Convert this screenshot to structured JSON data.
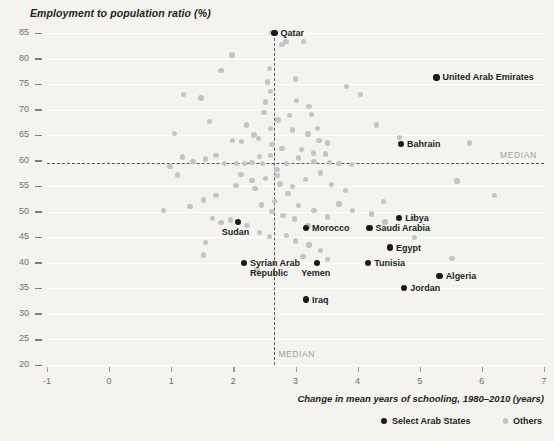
{
  "chart_data": {
    "type": "scatter",
    "title": "Employment to population ratio (%)",
    "ylabel": "Employment to population ratio (%)",
    "xlabel": "Change in mean years of schooling, 1980–2010 (years)",
    "xlim": [
      -1,
      7
    ],
    "ylim": [
      20,
      85
    ],
    "xticks": [
      -1,
      0,
      1,
      2,
      3,
      4,
      5,
      6,
      7
    ],
    "yticks": [
      20,
      25,
      30,
      35,
      40,
      45,
      50,
      55,
      60,
      65,
      70,
      75,
      80,
      85
    ],
    "grid": true,
    "median_x": 2.66,
    "median_y": 59.6,
    "median_label": "MEDIAN",
    "legend_position": "bottom-right",
    "colors": {
      "arab": "#1a1a1a",
      "others": "#c3c4c6",
      "median_line": "#58595b",
      "text": "#231f20",
      "tick_text": "#6d6e71"
    },
    "series": [
      {
        "name": "Select Arab States",
        "color": "#1a1a1a",
        "points": [
          {
            "label": "Qatar",
            "x": 2.66,
            "y": 85.0,
            "label_pos": "right"
          },
          {
            "label": "United Arab Emirates",
            "x": 5.27,
            "y": 76.3,
            "label_pos": "right"
          },
          {
            "label": "Bahrain",
            "x": 4.7,
            "y": 63.3,
            "label_pos": "right"
          },
          {
            "label": "Libya",
            "x": 4.67,
            "y": 48.8,
            "label_pos": "right"
          },
          {
            "label": "Saudi Arabia",
            "x": 4.19,
            "y": 46.8,
            "label_pos": "right"
          },
          {
            "label": "Egypt",
            "x": 4.52,
            "y": 43.0,
            "label_pos": "right"
          },
          {
            "label": "Tunisia",
            "x": 4.17,
            "y": 40.0,
            "label_pos": "right"
          },
          {
            "label": "Algeria",
            "x": 5.32,
            "y": 37.4,
            "label_pos": "right"
          },
          {
            "label": "Jordan",
            "x": 4.75,
            "y": 35.1,
            "label_pos": "right"
          },
          {
            "label": "Morocco",
            "x": 4.32,
            "y": 45.5,
            "label_pos": "right",
            "px": 306,
            "py": 228
          },
          {
            "label": "Yemen",
            "x": 3.35,
            "y": 40.0,
            "label_pos": "below"
          },
          {
            "label": "Iraq",
            "x": 3.17,
            "y": 32.8,
            "label_pos": "right"
          },
          {
            "label": "Sudan",
            "x": 2.07,
            "y": 48.0,
            "label_pos": "below"
          },
          {
            "label": "Syrian Arab\nRepublic",
            "x": 2.17,
            "y": 40.0,
            "label_pos": "right"
          }
        ]
      },
      {
        "name": "Others",
        "color": "#c3c4c6",
        "points": [
          {
            "x": 1.05,
            "y": 65.3
          },
          {
            "x": 1.8,
            "y": 77.6
          },
          {
            "x": 1.98,
            "y": 80.7
          },
          {
            "x": 2.33,
            "y": 65.0
          },
          {
            "x": 2.13,
            "y": 63.8
          },
          {
            "x": 1.99,
            "y": 63.9
          },
          {
            "x": 2.42,
            "y": 60.8
          },
          {
            "x": 2.18,
            "y": 59.4
          },
          {
            "x": 2.7,
            "y": 57.1
          },
          {
            "x": 2.55,
            "y": 75.4
          },
          {
            "x": 3.0,
            "y": 76.0
          },
          {
            "x": 3.22,
            "y": 70.6
          },
          {
            "x": 3.26,
            "y": 69.0
          },
          {
            "x": 3.35,
            "y": 66.3
          },
          {
            "x": 2.95,
            "y": 66.0
          },
          {
            "x": 3.2,
            "y": 65.2
          },
          {
            "x": 3.38,
            "y": 64.0
          },
          {
            "x": 3.52,
            "y": 63.5
          },
          {
            "x": 3.1,
            "y": 62.2
          },
          {
            "x": 3.29,
            "y": 61.5
          },
          {
            "x": 3.48,
            "y": 61.3
          },
          {
            "x": 3.05,
            "y": 60.5
          },
          {
            "x": 3.3,
            "y": 59.9
          },
          {
            "x": 3.55,
            "y": 59.7
          },
          {
            "x": 2.86,
            "y": 59.5
          },
          {
            "x": 3.7,
            "y": 59.4
          },
          {
            "x": 3.9,
            "y": 59.3
          },
          {
            "x": 2.47,
            "y": 59.5
          },
          {
            "x": 2.3,
            "y": 59.6
          },
          {
            "x": 2.05,
            "y": 59.5
          },
          {
            "x": 1.86,
            "y": 59.4
          },
          {
            "x": 2.62,
            "y": 85.1
          },
          {
            "x": 2.85,
            "y": 83.3
          },
          {
            "x": 3.13,
            "y": 83.3
          },
          {
            "x": 2.78,
            "y": 82.7
          },
          {
            "x": 3.82,
            "y": 74.5
          },
          {
            "x": 4.05,
            "y": 73.0
          },
          {
            "x": 4.3,
            "y": 67.0
          },
          {
            "x": 4.67,
            "y": 64.5
          },
          {
            "x": 5.8,
            "y": 63.5
          },
          {
            "x": 5.6,
            "y": 56.0
          },
          {
            "x": 6.2,
            "y": 53.2
          },
          {
            "x": 2.52,
            "y": 71.5
          },
          {
            "x": 2.49,
            "y": 69.4
          },
          {
            "x": 2.21,
            "y": 67.0
          },
          {
            "x": 1.62,
            "y": 67.7
          },
          {
            "x": 1.48,
            "y": 72.3
          },
          {
            "x": 1.2,
            "y": 73.0
          },
          {
            "x": 2.72,
            "y": 68.0
          },
          {
            "x": 2.9,
            "y": 68.8
          },
          {
            "x": 3.02,
            "y": 71.8
          },
          {
            "x": 2.4,
            "y": 64.4
          },
          {
            "x": 2.62,
            "y": 63.2
          },
          {
            "x": 2.78,
            "y": 62.4
          },
          {
            "x": 1.72,
            "y": 61.0
          },
          {
            "x": 1.55,
            "y": 60.3
          },
          {
            "x": 1.35,
            "y": 59.8
          },
          {
            "x": 1.18,
            "y": 60.7
          },
          {
            "x": 0.98,
            "y": 58.9
          },
          {
            "x": 1.1,
            "y": 57.2
          },
          {
            "x": 2.12,
            "y": 57.3
          },
          {
            "x": 2.3,
            "y": 56.1
          },
          {
            "x": 2.52,
            "y": 56.5
          },
          {
            "x": 2.75,
            "y": 55.4
          },
          {
            "x": 2.95,
            "y": 55.0
          },
          {
            "x": 3.16,
            "y": 56.3
          },
          {
            "x": 3.4,
            "y": 57.6
          },
          {
            "x": 3.58,
            "y": 55.3
          },
          {
            "x": 2.88,
            "y": 53.6
          },
          {
            "x": 2.66,
            "y": 52.0
          },
          {
            "x": 2.45,
            "y": 51.3
          },
          {
            "x": 2.62,
            "y": 50.1
          },
          {
            "x": 2.8,
            "y": 49.3
          },
          {
            "x": 3.05,
            "y": 51.2
          },
          {
            "x": 3.3,
            "y": 50.3
          },
          {
            "x": 3.52,
            "y": 49.0
          },
          {
            "x": 3.7,
            "y": 51.5
          },
          {
            "x": 3.92,
            "y": 50.2
          },
          {
            "x": 4.22,
            "y": 49.6
          },
          {
            "x": 4.44,
            "y": 48.0
          },
          {
            "x": 4.88,
            "y": 48.7
          },
          {
            "x": 1.72,
            "y": 53.2
          },
          {
            "x": 1.52,
            "y": 52.3
          },
          {
            "x": 1.3,
            "y": 51.0
          },
          {
            "x": 0.88,
            "y": 50.3
          },
          {
            "x": 1.95,
            "y": 48.4
          },
          {
            "x": 1.8,
            "y": 47.9
          },
          {
            "x": 1.66,
            "y": 48.7
          },
          {
            "x": 2.22,
            "y": 47.3
          },
          {
            "x": 2.42,
            "y": 46.0
          },
          {
            "x": 2.58,
            "y": 45.2
          },
          {
            "x": 2.86,
            "y": 45.4
          },
          {
            "x": 3.0,
            "y": 44.3
          },
          {
            "x": 3.22,
            "y": 43.5
          },
          {
            "x": 3.4,
            "y": 42.4
          },
          {
            "x": 3.12,
            "y": 41.3
          },
          {
            "x": 3.52,
            "y": 40.6
          },
          {
            "x": 3.2,
            "y": 47.2
          },
          {
            "x": 2.98,
            "y": 48.6
          },
          {
            "x": 1.55,
            "y": 44.0
          },
          {
            "x": 1.52,
            "y": 41.5
          },
          {
            "x": 2.38,
            "y": 38.6
          },
          {
            "x": 5.52,
            "y": 40.8
          },
          {
            "x": 4.92,
            "y": 45.0
          },
          {
            "x": 4.42,
            "y": 52.0
          },
          {
            "x": 3.8,
            "y": 54.2
          },
          {
            "x": 2.7,
            "y": 58.3
          },
          {
            "x": 2.6,
            "y": 61.0
          },
          {
            "x": 2.6,
            "y": 66.3
          },
          {
            "x": 2.6,
            "y": 73.5
          },
          {
            "x": 2.58,
            "y": 78.0
          },
          {
            "x": 2.35,
            "y": 54.6
          },
          {
            "x": 2.04,
            "y": 55.2
          }
        ]
      }
    ]
  },
  "legend": {
    "items": [
      {
        "name": "Select Arab States",
        "marker": "arab"
      },
      {
        "name": "Others",
        "marker": "other"
      }
    ]
  }
}
